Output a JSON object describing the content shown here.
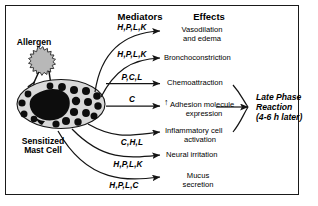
{
  "figure": {
    "border_color": "#1a1a1a",
    "background": "#ffffff"
  },
  "columns": {
    "mediators_header": "Mediators",
    "effects_header": "Effects"
  },
  "cell": {
    "allergen_label": "Allergen",
    "cell_label_line1": "Sensitized",
    "cell_label_line2": "Mast Cell",
    "body_fill": "#d9d9d9",
    "granule_fill": "#0d0d0d",
    "nucleus_fill": "#0d0d0d",
    "allergen_fill": "#b3b3b3",
    "outline": "#1a1a1a"
  },
  "pathways": [
    {
      "mediators": "H,P,L,K",
      "effect_line1": "Vasodilation",
      "effect_line2": "and edema",
      "arrow_style": "curved"
    },
    {
      "mediators": "H,P,L,K",
      "effect_line1": "Bronchoconstriction",
      "effect_line2": "",
      "arrow_style": "curved"
    },
    {
      "mediators": "P,C,L",
      "effect_line1": "Chemoattraction",
      "effect_line2": "",
      "arrow_style": "straight"
    },
    {
      "mediators": "C",
      "effect_prefix": "↑",
      "effect_line1": "Adhesion molecule",
      "effect_line2": "expression",
      "arrow_style": "straight"
    },
    {
      "mediators": "C,H,L",
      "effect_line1": "Inflammatory cell",
      "effect_line2": "activation",
      "arrow_style": "curved"
    },
    {
      "mediators": "H,P,L,K",
      "effect_line1": "Neural irritation",
      "effect_line2": "",
      "arrow_style": "curved"
    },
    {
      "mediators": "H,P,L,C",
      "effect_line1": "Mucus",
      "effect_line2": "secretion",
      "arrow_style": "curved"
    }
  ],
  "outcome": {
    "line1": "Late Phase",
    "line2": "Reaction",
    "line3": "(4-6 h later)"
  }
}
